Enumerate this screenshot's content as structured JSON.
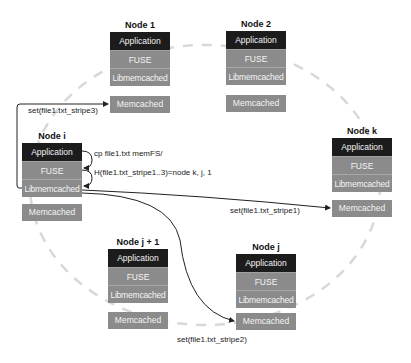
{
  "diagram": {
    "nodes": [
      {
        "id": "node-1",
        "title": "Node 1",
        "layers": [
          "Application",
          "FUSE",
          "Libmemcached"
        ],
        "memcached": "Memcached"
      },
      {
        "id": "node-2",
        "title": "Node 2",
        "layers": [
          "Application",
          "FUSE",
          "Libmemcached"
        ],
        "memcached": "Memcached"
      },
      {
        "id": "node-i",
        "title": "Node i",
        "layers": [
          "Application",
          "FUSE",
          "Libmemcached"
        ],
        "memcached": "Memcached"
      },
      {
        "id": "node-k",
        "title": "Node k",
        "layers": [
          "Application",
          "FUSE",
          "Libmemcached"
        ],
        "memcached": "Memcached"
      },
      {
        "id": "node-j1",
        "title": "Node j + 1",
        "layers": [
          "Application",
          "FUSE",
          "Libmemcached"
        ],
        "memcached": "Memcached"
      },
      {
        "id": "node-j",
        "title": "Node j",
        "layers": [
          "Application",
          "FUSE",
          "Libmemcached"
        ],
        "memcached": "Memcached"
      }
    ],
    "labels": {
      "set_stripe3": "set(file1.txt_stripe3)",
      "cp_cmd": "cp file1.txt memFS/",
      "hash": "H(file1.txt_stripe1..3)=node k, j, 1",
      "set_stripe1": "set(file1.txt_stripe1)",
      "set_stripe2": "set(file1.txt_stripe2)"
    },
    "colors": {
      "application": "#1c1c1c",
      "layer_gray": "#8b8b8b",
      "ring": "#d8d8d8",
      "arrow": "#222222"
    }
  }
}
